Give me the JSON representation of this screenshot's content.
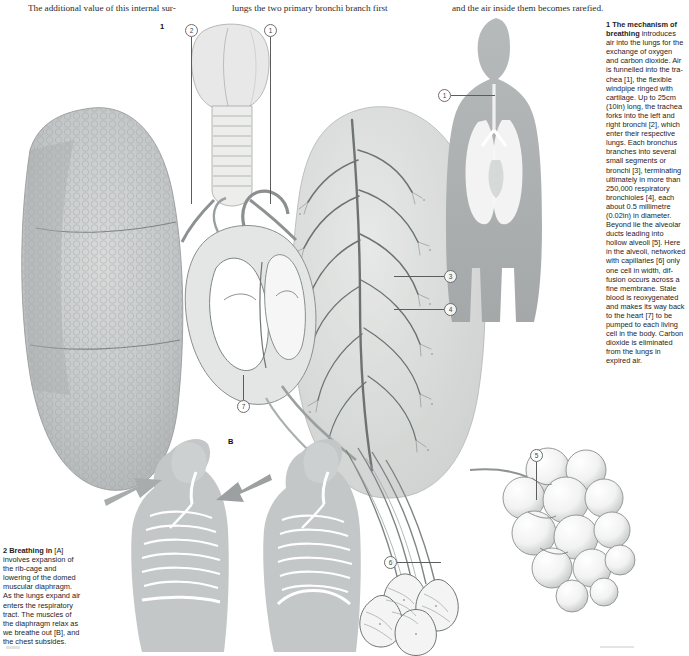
{
  "page": {
    "width": 689,
    "height": 656,
    "background": "#ffffff",
    "ink": "#1d1d1d"
  },
  "bodytext": {
    "col1": "The additional value of this internal sur-",
    "col2": "lungs the two primary bronchi branch first",
    "col3": "and the air inside them becomes rarefied."
  },
  "figures": {
    "fig1_number": "1",
    "fig2a_label": "2 A",
    "fig2b_label": "B"
  },
  "caption_right": {
    "lead_bold": "1 The mechanism of breathing",
    "body": " introduces air into the lungs for the exchange of oxygen and carbon dioxide. Air is funnelled into the tra­chea [1], the flex­ible windpipe ringed with cartilage. Up to 25cm (10in) long, the trachea forks into the left and right bronchi [2], which enter their respective lungs. Each bronchus branches into several small segments or bronchi [3], term­inating ultimately in more than 250,000 respiratory bronchioles [4], each about 0.5 milli­metre (0.02in) in diameter. Beyond lie the alveolar ducts leading into hollow alveoli [5]. Here in the alveoli, net­worked with capillar­ies [6] only one cell in width, dif­fusion occurs across a fine membrane. Stale blood is re­oxygenated and makes its way back to the heart [7] to be pumped to each living cell in the body. Carbon dioxide is eliminated from the lungs in expired air."
  },
  "caption_left": {
    "lead_bold": "2 Breathing in",
    "body": " [A] involves expansion of the rib-cage and lowering of the domed muscular diaphragm. As the lungs expand air enters the res­piratory tract. The muscles of the dia­phragm relax as we breathe out [B], and the chest subsides."
  },
  "callouts": [
    {
      "id": "callout-2-trachea-top",
      "label": "2",
      "x": 185,
      "y": 24
    },
    {
      "id": "callout-1-trachea-top",
      "label": "1",
      "x": 264,
      "y": 24
    },
    {
      "id": "callout-1-torso",
      "label": "1",
      "x": 438,
      "y": 89
    },
    {
      "id": "callout-3-bronchi",
      "label": "3",
      "x": 444,
      "y": 270
    },
    {
      "id": "callout-4-bronchioles",
      "label": "4",
      "x": 444,
      "y": 303
    },
    {
      "id": "callout-7-heart",
      "label": "7",
      "x": 237,
      "y": 400
    },
    {
      "id": "callout-5-alveoli",
      "label": "5",
      "x": 530,
      "y": 449
    },
    {
      "id": "callout-6-capillaries",
      "label": "6",
      "x": 384,
      "y": 556
    }
  ],
  "artwork": {
    "title": "human respiratory system anatomical plate",
    "elements": [
      "larynx and trachea",
      "left lung lobes with alveolar texture",
      "right lung with bronchial tree",
      "heart cross-section",
      "full-body torso silhouette with lungs",
      "alveolar sac cluster",
      "capillary network detail",
      "diaphragm inhalation diagram A",
      "diaphragm exhalation diagram B"
    ],
    "palette": {
      "paper": "#ffffff",
      "wash_grey": "#b9bcbd",
      "mid_grey": "#9fa3a4",
      "light_grey": "#dcdedd",
      "line": "#5c5c5c",
      "arrow_grey": "#a8abac"
    }
  }
}
